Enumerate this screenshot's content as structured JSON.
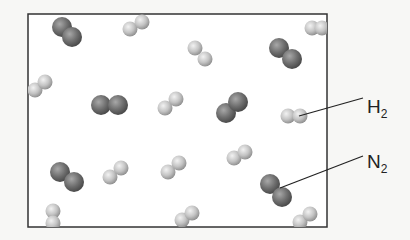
{
  "diagram": {
    "colors": {
      "background": "#f7f7f5",
      "box_fill": "#ffffff",
      "box_border": "#333333",
      "h2_atom": "#c9c9c9",
      "n2_atom": "#6e6e6e",
      "leader_line": "#222222"
    },
    "box": {
      "x": 28,
      "y": 14,
      "width": 299,
      "height": 213
    },
    "labels": [
      {
        "id": "h2",
        "element": "H",
        "subscript": "2",
        "x": 367,
        "y": 97,
        "line": {
          "x1": 299,
          "y1": 116,
          "x2": 363,
          "y2": 98
        }
      },
      {
        "id": "n2",
        "element": "N",
        "subscript": "2",
        "x": 367,
        "y": 152,
        "line": {
          "x1": 280,
          "y1": 188,
          "x2": 363,
          "y2": 156
        }
      }
    ],
    "molecules": [
      {
        "type": "N2",
        "atoms": [
          [
            62,
            27
          ],
          [
            72,
            37
          ]
        ]
      },
      {
        "type": "H2",
        "atoms": [
          [
            130,
            29
          ],
          [
            142,
            22
          ]
        ]
      },
      {
        "type": "H2",
        "atoms": [
          [
            312,
            28
          ],
          [
            322,
            28
          ]
        ]
      },
      {
        "type": "H2",
        "atoms": [
          [
            195,
            48
          ],
          [
            205,
            59
          ]
        ]
      },
      {
        "type": "N2",
        "atoms": [
          [
            279,
            48
          ],
          [
            292,
            59
          ]
        ]
      },
      {
        "type": "H2",
        "atoms": [
          [
            35,
            90
          ],
          [
            45,
            82
          ]
        ]
      },
      {
        "type": "N2",
        "atoms": [
          [
            101,
            105
          ],
          [
            118,
            105
          ]
        ]
      },
      {
        "type": "H2",
        "atoms": [
          [
            165,
            108
          ],
          [
            176,
            99
          ]
        ]
      },
      {
        "type": "N2",
        "atoms": [
          [
            226,
            113
          ],
          [
            238,
            102
          ]
        ]
      },
      {
        "type": "H2",
        "atoms": [
          [
            288,
            116
          ],
          [
            300,
            116
          ]
        ]
      },
      {
        "type": "H2",
        "atoms": [
          [
            234,
            158
          ],
          [
            245,
            152
          ]
        ]
      },
      {
        "type": "H2",
        "atoms": [
          [
            168,
            172
          ],
          [
            179,
            163
          ]
        ]
      },
      {
        "type": "H2",
        "atoms": [
          [
            110,
            177
          ],
          [
            121,
            168
          ]
        ]
      },
      {
        "type": "N2",
        "atoms": [
          [
            60,
            172
          ],
          [
            74,
            182
          ]
        ]
      },
      {
        "type": "N2",
        "atoms": [
          [
            270,
            184
          ],
          [
            282,
            197
          ]
        ]
      },
      {
        "type": "H2",
        "atoms": [
          [
            53,
            211
          ],
          [
            53,
            223
          ]
        ]
      },
      {
        "type": "H2",
        "atoms": [
          [
            182,
            220
          ],
          [
            192,
            213
          ]
        ]
      },
      {
        "type": "H2",
        "atoms": [
          [
            300,
            222
          ],
          [
            310,
            214
          ]
        ]
      }
    ]
  }
}
